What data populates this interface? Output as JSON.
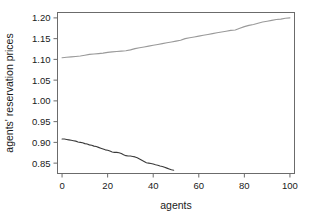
{
  "chart_data": {
    "type": "line",
    "title": "",
    "xlabel": "agents",
    "ylabel": "agents' reservation prices",
    "xlim": [
      -2,
      102
    ],
    "ylim": [
      0.825,
      1.213
    ],
    "grid": false,
    "legend": "none",
    "xticks": [
      0,
      20,
      40,
      60,
      80,
      100
    ],
    "xtick_labels": [
      "0",
      "20",
      "40",
      "60",
      "80",
      "100"
    ],
    "yticks": [
      0.85,
      0.9,
      0.95,
      1.0,
      1.05,
      1.1,
      1.15,
      1.2
    ],
    "ytick_labels": [
      "0.85",
      "0.90",
      "0.95",
      "1.00",
      "1.05",
      "1.10",
      "1.15",
      "1.20"
    ],
    "series": [
      {
        "name": "buyers-upper-curve",
        "color": "#9a9a9a",
        "x": [
          0,
          2,
          4,
          6,
          8,
          10,
          12,
          14,
          16,
          18,
          20,
          22,
          24,
          26,
          28,
          30,
          32,
          34,
          36,
          38,
          40,
          42,
          44,
          46,
          48,
          50,
          52,
          54,
          56,
          58,
          60,
          62,
          64,
          66,
          68,
          70,
          72,
          74,
          76,
          78,
          80,
          82,
          84,
          86,
          88,
          90,
          92,
          94,
          96,
          98,
          100
        ],
        "values": [
          1.104,
          1.105,
          1.106,
          1.107,
          1.108,
          1.11,
          1.112,
          1.113,
          1.114,
          1.115,
          1.117,
          1.118,
          1.119,
          1.12,
          1.121,
          1.123,
          1.126,
          1.128,
          1.13,
          1.132,
          1.134,
          1.136,
          1.138,
          1.14,
          1.142,
          1.144,
          1.146,
          1.15,
          1.152,
          1.154,
          1.156,
          1.158,
          1.16,
          1.162,
          1.164,
          1.166,
          1.168,
          1.17,
          1.171,
          1.175,
          1.179,
          1.182,
          1.184,
          1.187,
          1.19,
          1.192,
          1.194,
          1.196,
          1.197,
          1.199,
          1.2
        ]
      },
      {
        "name": "sellers-lower-curve",
        "color": "#3a3a3a",
        "x": [
          0,
          1,
          2,
          3,
          4,
          5,
          6,
          7,
          8,
          9,
          10,
          11,
          12,
          13,
          14,
          15,
          16,
          17,
          18,
          19,
          20,
          21,
          22,
          23,
          24,
          25,
          26,
          27,
          28,
          29,
          30,
          31,
          32,
          33,
          34,
          35,
          36,
          37,
          38,
          39,
          40,
          41,
          42,
          43,
          44,
          45,
          46,
          47,
          48,
          49
        ],
        "values": [
          0.908,
          0.908,
          0.907,
          0.906,
          0.905,
          0.904,
          0.903,
          0.901,
          0.9,
          0.899,
          0.897,
          0.896,
          0.894,
          0.893,
          0.891,
          0.89,
          0.888,
          0.886,
          0.884,
          0.882,
          0.881,
          0.879,
          0.877,
          0.876,
          0.876,
          0.875,
          0.873,
          0.87,
          0.868,
          0.867,
          0.867,
          0.866,
          0.865,
          0.863,
          0.86,
          0.857,
          0.854,
          0.851,
          0.85,
          0.849,
          0.848,
          0.846,
          0.845,
          0.843,
          0.842,
          0.84,
          0.838,
          0.836,
          0.834,
          0.833
        ]
      }
    ],
    "colors": {
      "axis": "#6b6b6b",
      "text": "#1a1a1a",
      "background": "#ffffff"
    }
  }
}
